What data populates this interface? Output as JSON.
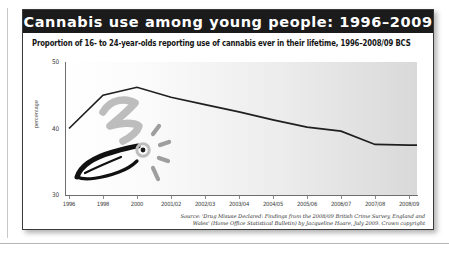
{
  "card": {
    "title": "Cannabis use among young people: 1996–2009",
    "subtitle": "Proportion of 16- to 24-year-olds reporting use of cannabis ever in their lifetime, 1996–2008/09 BCS",
    "source": "Source: 'Drug Misuse Declared: Findings from the 2008/09 British Crime Survey, England and Wales' (Home Office Statistical Bulletin) by Jacqueline Hoare, July 2009. Crown copyright",
    "colors": {
      "title_bar": "#1b1b1b",
      "title_text": "#ffffff",
      "series_line": "#1f1f1f",
      "axis": "#6e6e6e",
      "doodle_ink": "#111111",
      "doodle_smoke": "#b9b9b9"
    }
  },
  "chart_data": {
    "type": "line",
    "title": "Cannabis use among young people: 1996–2009",
    "subtitle": "Proportion of 16- to 24-year-olds reporting use of cannabis ever in their lifetime, 1996–2008/09 BCS",
    "xlabel": "",
    "ylabel": "percentage",
    "ylim": [
      30,
      50
    ],
    "yticks": [
      30,
      40,
      50
    ],
    "ytick_labels": [
      "30",
      "40",
      "50"
    ],
    "grid": false,
    "legend": null,
    "categories": [
      "1996",
      "1998",
      "2000",
      "2001/02",
      "2002/03",
      "2003/04",
      "2004/05",
      "2005/06",
      "2006/07",
      "2007/08",
      "2008/09"
    ],
    "series": [
      {
        "name": "16- to 24-year-olds ever used cannabis",
        "values": [
          40.0,
          45.0,
          46.2,
          44.7,
          43.6,
          42.5,
          41.3,
          40.2,
          39.6,
          37.6,
          37.5
        ]
      }
    ],
    "annotations": [
      {
        "kind": "doodle",
        "name": "cannabis-joint-doodle",
        "description": "Hand-drawn cigarette/joint with glowing ember and grey smoke squiggle overlaid on the left of the plot"
      }
    ]
  },
  "doodle": {
    "joint_label": "hand-drawn-joint",
    "ember_label": "glowing-ember",
    "smoke_label": "smoke-squiggle"
  }
}
